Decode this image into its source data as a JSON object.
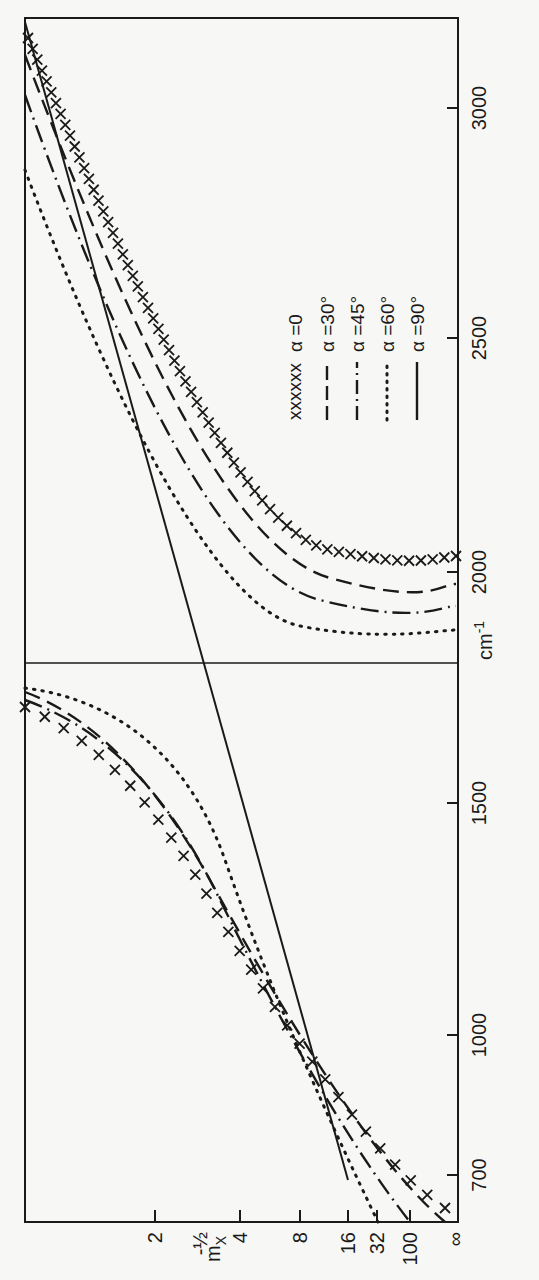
{
  "figure": {
    "orientation": "rotated-90-clockwise",
    "ink_color": "#1a1a1a",
    "paper_color": "#f7f7f5"
  },
  "axes": {
    "frequency_axis": {
      "unit_label": "cm",
      "unit_exponent": "-1",
      "ticks": [
        {
          "value": 3000,
          "label": "3000",
          "y": 108
        },
        {
          "value": 2500,
          "label": "2500",
          "y": 338
        },
        {
          "value": 2000,
          "label": "2000",
          "y": 572
        },
        {
          "value": 1500,
          "label": "1500",
          "y": 803
        },
        {
          "value": 1000,
          "label": "1000",
          "y": 1035
        },
        {
          "value": 700,
          "label": "700",
          "y": 1175
        }
      ]
    },
    "mass_axis": {
      "label": "m",
      "label_subscript": "X",
      "ticks": [
        {
          "label": "2",
          "x": 155
        },
        {
          "label": "4",
          "x": 240
        },
        {
          "label": "8",
          "x": 300
        },
        {
          "label": "16",
          "x": 348
        },
        {
          "label": "32",
          "x": 377
        },
        {
          "label": "100",
          "x": 410
        },
        {
          "label": "∞",
          "x": 455
        }
      ],
      "extra_label": {
        "label": "-½",
        "x": 200
      }
    }
  },
  "legend": {
    "items": [
      {
        "marker": "xxxxxx",
        "label": "α =0",
        "style": "cross"
      },
      {
        "marker": "— —",
        "label": "α =30°",
        "style": "dashed"
      },
      {
        "marker": "—·—",
        "label": "α =45°",
        "style": "dashdot"
      },
      {
        "marker": "······",
        "label": "α =60°",
        "style": "dotted"
      },
      {
        "marker": "———",
        "label": "α =90°",
        "style": "solid"
      }
    ]
  },
  "chart_data": {
    "type": "line",
    "title": "",
    "xlabel": "m_X",
    "ylabel": "cm^-1",
    "x_categories": [
      "2",
      "-½",
      "4",
      "8",
      "16",
      "32",
      "100",
      "∞"
    ],
    "y_ticks": [
      700,
      1000,
      1500,
      2000,
      2500,
      3000
    ],
    "ylim": [
      600,
      3250
    ],
    "horizontal_reference_line": 1800,
    "series": [
      {
        "name": "α =0",
        "style": "cross",
        "upper_branch_asymptote": 2060,
        "upper_branch_max": 3250,
        "lower_branch_top": 1770,
        "lower_branch_at_inf": 640
      },
      {
        "name": "α =30°",
        "style": "dashed",
        "upper_branch_asymptote": 1980,
        "upper_branch_max": 3200,
        "lower_branch_top": 1780,
        "lower_branch_at_inf": 620
      },
      {
        "name": "α =45°",
        "style": "dashdot",
        "upper_branch_asymptote": 1910,
        "upper_branch_max": 3130,
        "lower_branch_top": 1790,
        "lower_branch_at_inf": 620
      },
      {
        "name": "α =60°",
        "style": "dotted",
        "upper_branch_asymptote": 1840,
        "upper_branch_max": 3050,
        "lower_branch_top": 1810,
        "lower_branch_at_inf": 620
      },
      {
        "name": "α =90°",
        "style": "solid",
        "line_from": {
          "m": "16",
          "cm-1": 700
        },
        "line_to": {
          "m": "2",
          "cm-1": 3200
        }
      }
    ],
    "common_crossing_point": {
      "m_X": "≈6",
      "cm-1": 1220
    },
    "legend_position": "inside-upper-right"
  }
}
